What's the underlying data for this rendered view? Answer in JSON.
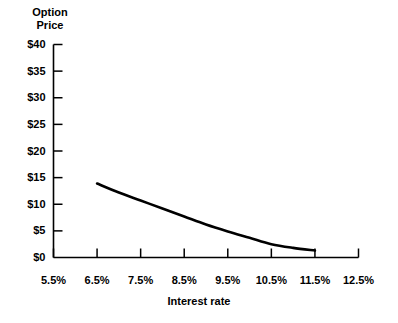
{
  "chart_data": {
    "type": "line",
    "title": "",
    "xlabel": "Interest rate",
    "ylabel": "Option Price",
    "ylabel_lines": [
      "Option",
      "Price"
    ],
    "xlim": [
      5.5,
      12.5
    ],
    "ylim": [
      0,
      40
    ],
    "grid": false,
    "legend": null,
    "xticks": [
      5.5,
      6.5,
      7.5,
      8.5,
      9.5,
      10.5,
      11.5,
      12.5
    ],
    "xtick_labels": [
      "5.5%",
      "6.5%",
      "7.5%",
      "8.5%",
      "9.5%",
      "10.5%",
      "11.5%",
      "12.5%"
    ],
    "yticks": [
      0,
      5,
      10,
      15,
      20,
      25,
      30,
      35,
      40
    ],
    "ytick_labels": [
      "$0",
      "$5",
      "$10",
      "$15",
      "$20",
      "$25",
      "$30",
      "$35",
      "$40"
    ],
    "series": [
      {
        "name": "Option price vs interest rate",
        "color": "#000000",
        "linewidth": 2.6,
        "x": [
          6.5,
          7.0,
          7.5,
          8.0,
          8.5,
          9.0,
          9.5,
          10.0,
          10.5,
          11.0,
          11.5
        ],
        "values": [
          13.9,
          12.2,
          10.7,
          9.2,
          7.7,
          6.2,
          4.9,
          3.7,
          2.5,
          1.8,
          1.3
        ]
      }
    ]
  },
  "axis_style": {
    "axis_color": "#000000",
    "tick_direction": "inward",
    "background": "#ffffff"
  }
}
